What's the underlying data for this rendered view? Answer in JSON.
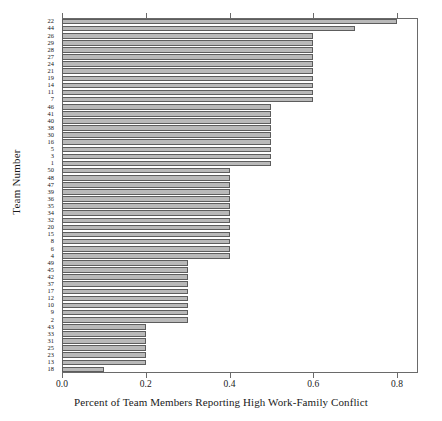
{
  "chart_data": {
    "type": "bar",
    "orientation": "horizontal",
    "title": "",
    "xlabel": "Percent of Team Members Reporting High Work-Family Conflict",
    "ylabel": "Team Number",
    "xlim": [
      0.0,
      0.85
    ],
    "ylim": [
      0,
      50
    ],
    "grid": false,
    "legend": null,
    "xticks": [
      "0.0",
      "0.2",
      "0.4",
      "0.6",
      "0.8"
    ],
    "xtick_values": [
      0.0,
      0.2,
      0.4,
      0.6,
      0.8
    ],
    "categories": [
      "22",
      "44",
      "26",
      "29",
      "28",
      "27",
      "24",
      "21",
      "19",
      "14",
      "11",
      "7",
      "46",
      "41",
      "40",
      "38",
      "30",
      "16",
      "5",
      "3",
      "1",
      "50",
      "48",
      "47",
      "39",
      "36",
      "35",
      "34",
      "32",
      "20",
      "15",
      "8",
      "6",
      "4",
      "49",
      "45",
      "42",
      "37",
      "17",
      "12",
      "10",
      "9",
      "2",
      "43",
      "33",
      "31",
      "25",
      "23",
      "13",
      "18"
    ],
    "values": [
      0.8,
      0.7,
      0.6,
      0.6,
      0.6,
      0.6,
      0.6,
      0.6,
      0.6,
      0.6,
      0.6,
      0.6,
      0.5,
      0.5,
      0.5,
      0.5,
      0.5,
      0.5,
      0.5,
      0.5,
      0.5,
      0.4,
      0.4,
      0.4,
      0.4,
      0.4,
      0.4,
      0.4,
      0.4,
      0.4,
      0.4,
      0.4,
      0.4,
      0.4,
      0.3,
      0.3,
      0.3,
      0.3,
      0.3,
      0.3,
      0.3,
      0.3,
      0.3,
      0.2,
      0.2,
      0.2,
      0.2,
      0.2,
      0.2,
      0.1
    ],
    "bar_color": "#b9b9b9",
    "bar_edge_color": "#5d5d5d"
  }
}
